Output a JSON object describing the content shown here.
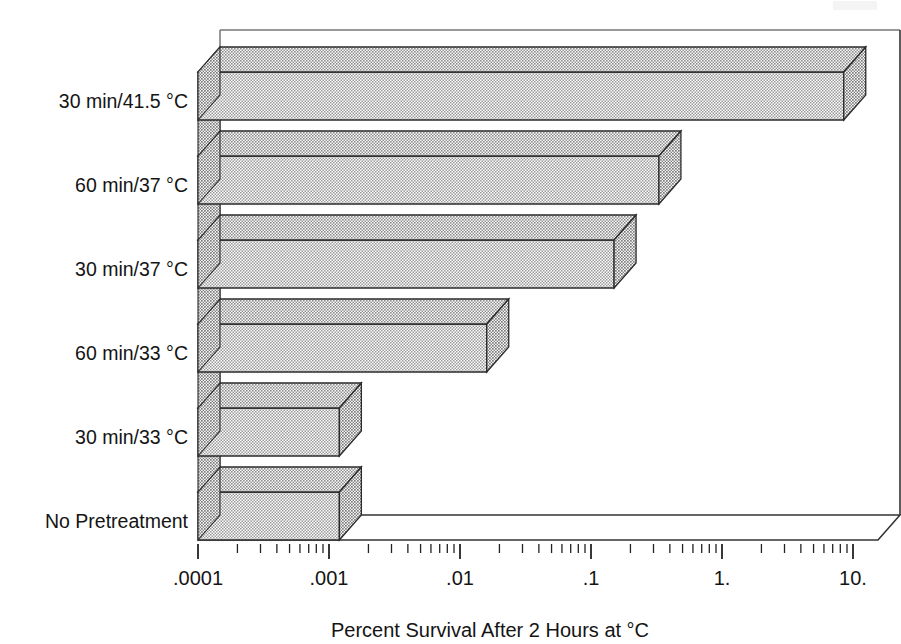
{
  "figure": {
    "background_color": "#ffffff",
    "ink_color": "#141414",
    "bar_fill_color": "#d9d9d9",
    "bar_top_color": "#cfcfcf",
    "bar_side_color": "#c4c4c4"
  },
  "chart_data": {
    "type": "bar",
    "orientation": "horizontal",
    "projection": "3d-isometric",
    "title": "",
    "subtitle": "",
    "xlabel": "Percent Survival After 2 Hours at °C",
    "ylabel": "",
    "xscale": "log",
    "xlim": [
      0.0001,
      10
    ],
    "xticks": [
      0.0001,
      0.001,
      0.01,
      0.1,
      1,
      10
    ],
    "xticklabels": [
      ".0001",
      ".001",
      ".01",
      ".1",
      "1.",
      "10."
    ],
    "minor_ticks": true,
    "grid": false,
    "legend": null,
    "categories": [
      "No Pretreatment",
      "30 min/33 °C",
      "60 min/33 °C",
      "30 min/37 °C",
      "60 min/37 °C",
      "30 min/41.5 °C"
    ],
    "values": [
      0.0012,
      0.0012,
      0.016,
      0.15,
      0.33,
      8.5
    ],
    "series": [
      {
        "name": "Percent survival",
        "values": [
          0.0012,
          0.0012,
          0.016,
          0.15,
          0.33,
          8.5
        ]
      }
    ],
    "points": [
      {
        "category": "No Pretreatment",
        "value": 0.0012
      },
      {
        "category": "30 min/33 °C",
        "value": 0.0012
      },
      {
        "category": "60 min/33 °C",
        "value": 0.016
      },
      {
        "category": "30 min/37 °C",
        "value": 0.15
      },
      {
        "category": "60 min/37 °C",
        "value": 0.33
      },
      {
        "category": "30 min/41.5 °C",
        "value": 8.5
      }
    ]
  },
  "axis": {
    "x_title": "Percent Survival After 2 Hours at °C",
    "tick_labels": [
      ".0001",
      ".001",
      ".01",
      ".1",
      "1.",
      "10."
    ],
    "category_labels": [
      "30 min/41.5 °C",
      "60 min/37 °C",
      "30 min/37 °C",
      "60 min/33 °C",
      "30 min/33 °C",
      "No Pretreatment"
    ]
  }
}
